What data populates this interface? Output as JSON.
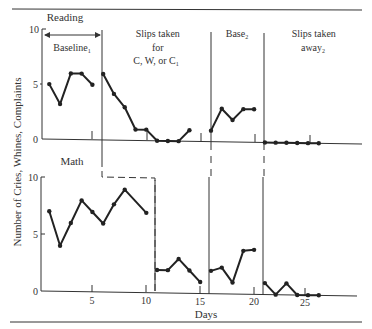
{
  "chart_data": {
    "type": "line",
    "title": "",
    "xlabel": "Days",
    "ylabel": "Number of Cries, Whines, Complaints",
    "x_ticks": [
      5,
      10,
      15,
      20,
      25
    ],
    "y_ticks": [
      0,
      5,
      10
    ],
    "ylim": [
      0,
      10
    ],
    "xlim": [
      0,
      30
    ],
    "phases": [
      {
        "label": "Baseline₁",
        "start_day": 1,
        "end_day": 5
      },
      {
        "label": "Slips taken for C, W, or C₁",
        "start_day": 6,
        "end_day": 15
      },
      {
        "label": "Base₂",
        "start_day": 16,
        "end_day": 20
      },
      {
        "label": "Slips taken away₂",
        "start_day": 21,
        "end_day": 26
      }
    ],
    "panels": [
      {
        "name": "Reading",
        "series": [
          {
            "phase": "Baseline₁",
            "x": [
              1,
              2,
              3,
              4,
              5
            ],
            "values": [
              5,
              3.2,
              6,
              6,
              5
            ]
          },
          {
            "phase": "Slips taken for C, W, or C₁",
            "x": [
              6,
              7,
              8,
              9,
              10,
              11,
              12,
              13,
              14
            ],
            "values": [
              6,
              4.2,
              3,
              1,
              1,
              0,
              0,
              0,
              1
            ]
          },
          {
            "phase": "Base₂",
            "x": [
              16,
              17,
              18,
              19,
              20
            ],
            "values": [
              1,
              3,
              2,
              3,
              3
            ]
          },
          {
            "phase": "Slips taken away₂",
            "x": [
              21,
              22,
              23,
              24,
              25,
              26
            ],
            "values": [
              0,
              0,
              0,
              0,
              0,
              0
            ]
          }
        ]
      },
      {
        "name": "Math",
        "series": [
          {
            "phase": "Baseline₁",
            "x": [
              1,
              2,
              3,
              4,
              5,
              6,
              7,
              8,
              10
            ],
            "values": [
              7,
              4,
              6,
              8,
              7,
              6,
              7.7,
              9,
              7
            ]
          },
          {
            "phase": "Slips taken for C, W, or C₁",
            "x": [
              11,
              12,
              13,
              14,
              15
            ],
            "values": [
              2,
              2,
              3,
              2,
              1
            ]
          },
          {
            "phase": "Base₂",
            "x": [
              16,
              17,
              18,
              19,
              20
            ],
            "values": [
              2,
              2.3,
              1,
              3.8,
              3.9
            ]
          },
          {
            "phase": "Slips taken away₂",
            "x": [
              21,
              22,
              23,
              24,
              25,
              26
            ],
            "values": [
              1,
              0,
              1,
              0,
              0,
              0
            ]
          }
        ]
      }
    ],
    "grid": false,
    "legend": "none"
  },
  "labels": {
    "panel_top": "Reading",
    "panel_bottom": "Math",
    "phase_baseline": "Baseline",
    "phase_baseline_sub": "1",
    "phase_slips_line1": "Slips taken",
    "phase_slips_line2": "for",
    "phase_slips_line3": "C, W, or C",
    "phase_slips_sub": "1",
    "phase_base2": "Base",
    "phase_base2_sub": "2",
    "phase_away_line1": "Slips taken",
    "phase_away_line2": "away",
    "phase_away_sub": "2",
    "y_axis": "Number of Cries, Whines, Complaints",
    "x_axis": "Days",
    "y_top_10": "10",
    "y_top_5": "5",
    "y_top_0": "0",
    "y_bot_10": "10",
    "y_bot_5": "5",
    "y_bot_0": "0",
    "x_5": "5",
    "x_10": "10",
    "x_15": "15",
    "x_20": "20",
    "x_25": "25"
  }
}
